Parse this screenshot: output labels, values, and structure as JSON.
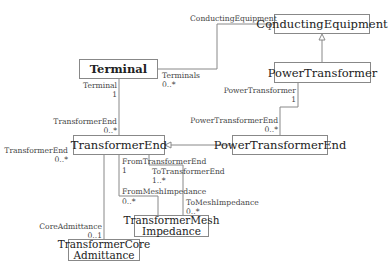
{
  "classes": {
    "conducting_equipment": "ConductingEquipment",
    "terminal": "Terminal",
    "power_transformer": "PowerTransformer",
    "transformer_end": "TransformerEnd",
    "power_transformer_end": "PowerTransformerEnd",
    "mesh_impedance_line1": "TransformerMesh",
    "mesh_impedance_line2": "Impedance",
    "core_admittance_line1": "TransformerCore",
    "core_admittance_line2": "Admittance"
  },
  "associations": {
    "terminal_ce": {
      "ce_role": "ConductingEquipment",
      "ce_mult": "1",
      "terminal_role": "Terminals",
      "terminal_mult": "0..*"
    },
    "terminal_te": {
      "terminal_role": "Terminal",
      "terminal_mult": "1",
      "te_role": "TransformerEnd",
      "te_mult": "0..*"
    },
    "pt_pte": {
      "pt_role": "PowerTransformer",
      "pt_mult": "1",
      "pte_role": "PowerTransformerEnd",
      "pte_mult": "0..*"
    },
    "te_core": {
      "te_role": "TransformerEnd",
      "te_mult": "0..*",
      "core_role": "CoreAdmittance",
      "core_mult": "0..1"
    },
    "from_mesh": {
      "from_te_role": "FromTransformerEnd",
      "from_te_mult": "1",
      "from_mesh_role": "FromMeshImpedance",
      "from_mesh_mult": "0..*"
    },
    "to_mesh": {
      "to_te_role": "ToTransformerEnd",
      "to_te_mult": "1..*",
      "to_mesh_role": "ToMeshImpedance",
      "to_mesh_mult": "0..*"
    }
  }
}
